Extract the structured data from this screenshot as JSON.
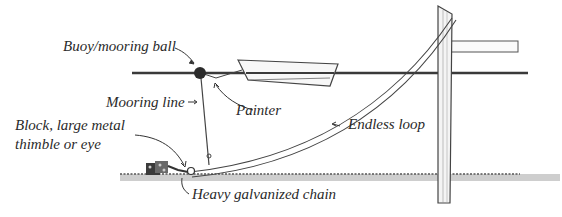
{
  "diagram": {
    "type": "mooring-system-illustration",
    "labels": {
      "buoy": "Buoy/mooring ball",
      "mooring_line": "Mooring line",
      "painter": "Painter",
      "endless_loop": "Endless loop",
      "block_line1": "Block, large metal",
      "block_line2": "thimble or eye",
      "chain": "Heavy galvanized chain"
    },
    "components": [
      "buoy",
      "dinghy",
      "painter",
      "mooring-line",
      "endless-loop",
      "pulley-block",
      "anchor-weight",
      "chain",
      "dock-post",
      "dock-beam",
      "water-surface",
      "seabed"
    ],
    "colors": {
      "ink": "#2a2a2a",
      "water_line": "#3a3a3a",
      "seabed": "#8a8a8a",
      "buoy": "#2b2b2b"
    }
  }
}
